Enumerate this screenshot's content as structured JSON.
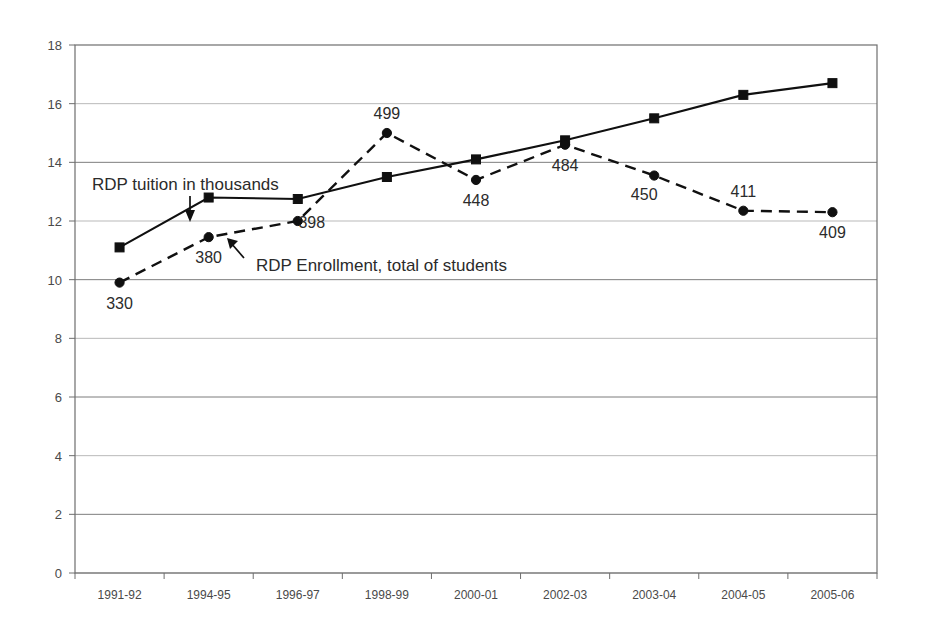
{
  "chart_data": {
    "type": "line",
    "title": "",
    "subtitle": "",
    "xlabel": "",
    "ylabel": "",
    "ylim": [
      0,
      18
    ],
    "yticks": [
      0,
      2,
      4,
      6,
      8,
      10,
      12,
      14,
      16,
      18
    ],
    "grid": true,
    "legend_position": "none",
    "categories": [
      "1991-92",
      "1994-95",
      "1996-97",
      "1998-99",
      "2000-01",
      "2002-03",
      "2003-04",
      "2004-05",
      "2005-06"
    ],
    "series": [
      {
        "name": "RDP tuition in thousands",
        "marker": "square",
        "line_style": "solid",
        "values": [
          11.1,
          12.8,
          12.75,
          13.5,
          14.1,
          14.75,
          15.5,
          16.3,
          16.7
        ],
        "point_labels": [
          "",
          "",
          "",
          "",
          "",
          "",
          "",
          "",
          ""
        ]
      },
      {
        "name": "RDP Enrollment, total of students",
        "marker": "circle",
        "line_style": "dashed",
        "values": [
          9.9,
          11.45,
          12.0,
          15.0,
          13.4,
          14.6,
          13.55,
          12.35,
          12.3
        ],
        "point_labels": [
          "330",
          "380",
          "398",
          "499",
          "448",
          "484",
          "450",
          "411",
          "409"
        ],
        "label_positions": [
          "below",
          "below",
          "right",
          "above",
          "below",
          "below",
          "left",
          "above",
          "below"
        ]
      }
    ],
    "annotations": [
      {
        "text": "RDP tuition in thousands",
        "points_to": "tuition-series",
        "arrow": "down"
      },
      {
        "text": "RDP Enrollment, total of students",
        "points_to": "enrollment-series",
        "arrow": "up-left"
      }
    ],
    "colors": {
      "line": "#101010",
      "grid": "#7d7d7d",
      "text": "#2b2b2b",
      "axis": "#6e6e6e"
    }
  }
}
